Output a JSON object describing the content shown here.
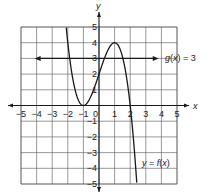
{
  "chart_data": {
    "type": "line",
    "title": "",
    "xlabel": "x",
    "ylabel": "y",
    "xlim": [
      -5,
      5
    ],
    "ylim": [
      -5,
      5
    ],
    "grid": true,
    "x_ticks": [
      "-5",
      "-4",
      "-3",
      "-2",
      "-1",
      "0",
      "1",
      "2",
      "3",
      "4",
      "5"
    ],
    "y_ticks": [
      "-5",
      "-4",
      "-3",
      "-2",
      "-1",
      "1",
      "2",
      "3",
      "4",
      "5"
    ],
    "series": [
      {
        "name": "y = f(x)",
        "label_prefix": "y = ",
        "label_func": "f",
        "label_arg": "x",
        "formula": "-x^3 + 3x + 2",
        "key_points": [
          [
            -2,
            4
          ],
          [
            -1,
            0
          ],
          [
            0,
            2
          ],
          [
            1,
            4
          ],
          [
            2,
            0
          ]
        ],
        "domain_drawn": [
          -2.1,
          2.42
        ]
      },
      {
        "name": "g(x) = 3",
        "label_func": "g",
        "label_arg": "x",
        "label_rest": " = 3",
        "formula": "3",
        "domain_drawn": [
          -4,
          3.7
        ],
        "arrows": "both"
      }
    ]
  },
  "colors": {
    "grid": "#555555",
    "curve": "#1a1a1a",
    "text": "#222222"
  }
}
